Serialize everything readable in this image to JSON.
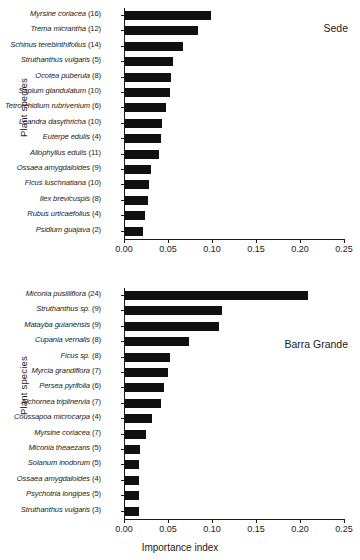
{
  "figure": {
    "axis": {
      "ticks": [
        "0.00",
        "0.05",
        "0.10",
        "0.15",
        "0.20",
        "0.25"
      ],
      "xlabel": "Importance index",
      "ylabel": "Plant species"
    }
  },
  "chart_data": [
    {
      "type": "bar",
      "orientation": "horizontal",
      "title": "Sede",
      "xlabel": "",
      "ylabel": "Plant species",
      "xlim": [
        0.0,
        0.25
      ],
      "xticks": [
        0.0,
        0.05,
        0.1,
        0.15,
        0.2,
        0.25
      ],
      "grid": false,
      "legend": "none",
      "annotation": "Sede",
      "categories": [
        "Myrsine coriacea (16)",
        "Trema micrantha (12)",
        "Schinus terebinthifolius (14)",
        "Struthanthus vulgaris (5)",
        "Ocotea puberula (8)",
        "Sapium glandulatum (10)",
        "Tetrorchidium rubrivenium (6)",
        "Leandra dasythricha (10)",
        "Euterpe edulis (4)",
        "Allophyllus edulis (11)",
        "Ossaea amygdaloides (9)",
        "Ficus luschnatiana (10)",
        "Ilex brevicuspis (8)",
        "Rubus urticaefolius (4)",
        "Psidium guajava (2)"
      ],
      "species": [
        "Myrsine coriacea",
        "Trema micrantha",
        "Schinus terebinthifolius",
        "Struthanthus vulgaris",
        "Ocotea puberula",
        "Sapium glandulatum",
        "Tetrorchidium rubrivenium",
        "Leandra dasythricha",
        "Euterpe edulis",
        "Allophyllus edulis",
        "Ossaea amygdaloides",
        "Ficus luschnatiana",
        "Ilex brevicuspis",
        "Rubus urticaefolius",
        "Psidium guajava"
      ],
      "counts": [
        16,
        12,
        14,
        5,
        8,
        10,
        6,
        10,
        4,
        11,
        9,
        10,
        8,
        4,
        2
      ],
      "values": [
        0.098,
        0.083,
        0.066,
        0.055,
        0.052,
        0.051,
        0.047,
        0.042,
        0.041,
        0.039,
        0.029,
        0.027,
        0.026,
        0.023,
        0.02
      ]
    },
    {
      "type": "bar",
      "orientation": "horizontal",
      "title": "Barra Grande",
      "xlabel": "Importance index",
      "ylabel": "Plant species",
      "xlim": [
        0.0,
        0.25
      ],
      "xticks": [
        0.0,
        0.05,
        0.1,
        0.15,
        0.2,
        0.25
      ],
      "grid": false,
      "legend": "none",
      "annotation": "Barra Grande",
      "categories": [
        "Miconia pusilliflora (24)",
        "Struthanthus sp. (9)",
        "Matayba guianensis (9)",
        "Cupania vernalis (8)",
        "Ficus sp. (8)",
        "Myrcia grandiflora (7)",
        "Persea pyrifolia (6)",
        "Alchornea triplinervia (7)",
        "Coussapoa microcarpa (4)",
        "Myrsine coriacea (7)",
        "Miconia theaezans (5)",
        "Solanum inodorum (5)",
        "Ossaea amygdaloides (4)",
        "Psychotria longipes (5)",
        "Struthanthus vulgaris (3)"
      ],
      "species": [
        "Miconia pusilliflora",
        "Struthanthus sp.",
        "Matayba guianensis",
        "Cupania vernalis",
        "Ficus sp.",
        "Myrcia grandiflora",
        "Persea pyrifolia",
        "Alchornea triplinervia",
        "Coussapoa microcarpa",
        "Myrsine coriacea",
        "Miconia theaezans",
        "Solanum inodorum",
        "Ossaea amygdaloides",
        "Psychotria longipes",
        "Struthanthus vulgaris"
      ],
      "counts": [
        24,
        9,
        9,
        8,
        8,
        7,
        6,
        7,
        4,
        7,
        5,
        5,
        4,
        5,
        3
      ],
      "values": [
        0.208,
        0.11,
        0.107,
        0.073,
        0.051,
        0.049,
        0.044,
        0.041,
        0.031,
        0.024,
        0.017,
        0.016,
        0.016,
        0.016,
        0.016
      ]
    }
  ]
}
